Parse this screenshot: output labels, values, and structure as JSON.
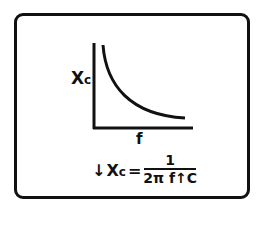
{
  "diagram": {
    "y_axis_label_main": "X",
    "y_axis_label_sub": "c",
    "x_axis_label": "f",
    "curve_description": "Xc decreases as f increases (inverse relationship)",
    "formula": {
      "lhs_arrow": "↓",
      "lhs_main": "X",
      "lhs_sub": "c",
      "equals": "=",
      "numerator": "1",
      "denominator": "2π f↑C"
    },
    "colors": {
      "ink": "#111111",
      "background": "#ffffff"
    }
  }
}
